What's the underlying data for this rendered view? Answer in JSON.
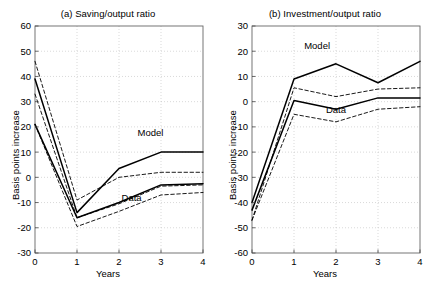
{
  "figure": {
    "background": "#ffffff",
    "line_color": "#000000",
    "grid_color": "#bfbfbf"
  },
  "chart_data": [
    {
      "type": "line",
      "panel": "a",
      "title": "(a) Saving/output ratio",
      "xlabel": "Years",
      "ylabel": "Basis points increase",
      "xlim": [
        0,
        4
      ],
      "ylim": [
        -30,
        60
      ],
      "xticks": [
        0,
        1,
        2,
        3,
        4
      ],
      "xticklabels": [
        "0",
        "1",
        "2",
        "3",
        "4"
      ],
      "yticks": [
        -30,
        -20,
        -10,
        0,
        10,
        20,
        30,
        40,
        50,
        60
      ],
      "yticklabels": [
        "-30",
        "-20",
        "-10",
        "0",
        "10",
        "20",
        "30",
        "40",
        "50",
        "60"
      ],
      "grid": true,
      "legend": "inline-annotations",
      "annotations": [
        {
          "text": "Model",
          "x": 2.75,
          "y": 16.5
        },
        {
          "text": "Data",
          "x": 2.3,
          "y": -9.5
        }
      ],
      "x": [
        0,
        1,
        2,
        3,
        4
      ],
      "series": [
        {
          "name": "Model",
          "style": "solid",
          "values": [
            39,
            -14,
            3.5,
            10,
            10
          ]
        },
        {
          "name": "Model upper band",
          "style": "dashed",
          "values": [
            46,
            -9,
            0,
            2,
            2
          ]
        },
        {
          "name": "Model lower band",
          "style": "dashed",
          "values": [
            33,
            -16,
            -10.5,
            -3.5,
            -3
          ]
        },
        {
          "name": "Data",
          "style": "solid",
          "values": [
            21,
            -16,
            -10,
            -3,
            -2.5
          ]
        },
        {
          "name": "Data lower band",
          "style": "dashed",
          "values": [
            21,
            -19.5,
            -13.5,
            -7,
            -6
          ]
        }
      ]
    },
    {
      "type": "line",
      "panel": "b",
      "title": "(b) Investment/output ratio",
      "xlabel": "Years",
      "ylabel": "Basis points increase",
      "xlim": [
        0,
        4
      ],
      "ylim": [
        -60,
        30
      ],
      "xticks": [
        0,
        1,
        2,
        3,
        4
      ],
      "xticklabels": [
        "0",
        "1",
        "2",
        "3",
        "4"
      ],
      "yticks": [
        -60,
        -50,
        -40,
        -30,
        -20,
        -10,
        0,
        10,
        20,
        30
      ],
      "yticklabels": [
        "-60",
        "-50",
        "-40",
        "-30",
        "-20",
        "-10",
        "0",
        "10",
        "20",
        "30"
      ],
      "grid": true,
      "legend": "inline-annotations",
      "annotations": [
        {
          "text": "Model",
          "x": 1.55,
          "y": 21
        },
        {
          "text": "Data",
          "x": 2.0,
          "y": -4.5
        }
      ],
      "x": [
        0,
        1,
        2,
        3,
        4
      ],
      "series": [
        {
          "name": "Model",
          "style": "solid",
          "values": [
            -40,
            9,
            15,
            7.5,
            16
          ]
        },
        {
          "name": "Model band",
          "style": "dashed",
          "values": [
            -47,
            5.5,
            2,
            5,
            5.5
          ]
        },
        {
          "name": "Data",
          "style": "solid",
          "values": [
            -43,
            0.5,
            -3,
            1.5,
            1.5
          ]
        },
        {
          "name": "Data band",
          "style": "dashed",
          "values": [
            -47,
            -5,
            -8,
            -3,
            -2
          ]
        }
      ]
    }
  ]
}
